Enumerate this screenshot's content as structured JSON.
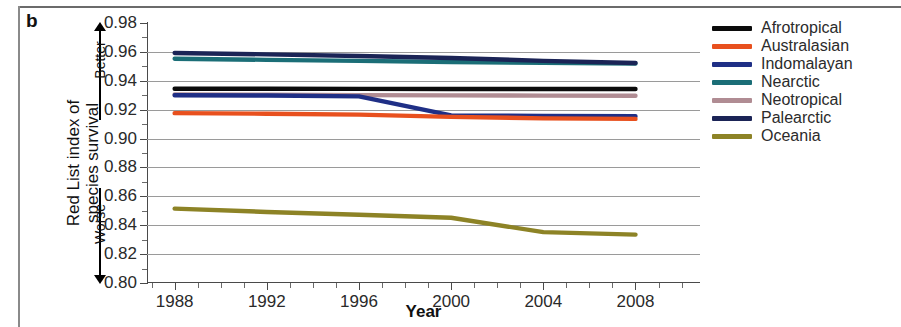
{
  "panel": {
    "label": "b"
  },
  "axes": {
    "y_title": "Red List index of\nspecies survival",
    "x_title": "Year",
    "y_ticks": [
      "0.98",
      "0.96",
      "0.94",
      "0.92",
      "0.90",
      "0.88",
      "0.86",
      "0.84",
      "0.82",
      "0.80"
    ],
    "x_ticks": [
      "1988",
      "1992",
      "1996",
      "2000",
      "2004",
      "2008"
    ],
    "direction_up": "Better",
    "direction_down": "Worse"
  },
  "legend": {
    "items": [
      {
        "label": "Afrotropical",
        "color": "#0b0b0b"
      },
      {
        "label": "Australasian",
        "color": "#e8501e"
      },
      {
        "label": "Indomalayan",
        "color": "#1f2f86"
      },
      {
        "label": "Nearctic",
        "color": "#1b6e77"
      },
      {
        "label": "Neotropical",
        "color": "#b08c93"
      },
      {
        "label": "Palearctic",
        "color": "#1b2456"
      },
      {
        "label": "Oceania",
        "color": "#8d8326"
      }
    ]
  },
  "chart_data": {
    "type": "line",
    "title": "",
    "xlabel": "Year",
    "ylabel": "Red List index of species survival",
    "xlim": [
      1986.8,
      2010.8
    ],
    "ylim": [
      0.8,
      0.98
    ],
    "ytick_step": 0.02,
    "xtick_step": 4,
    "grid": "horizontal",
    "legend_position": "right",
    "annotations": [
      {
        "text": "Better",
        "meaning": "higher index is better",
        "direction": "up"
      },
      {
        "text": "Worse",
        "meaning": "lower index is worse",
        "direction": "down"
      }
    ],
    "x": [
      1988,
      1992,
      1996,
      2000,
      2004,
      2008
    ],
    "series": [
      {
        "name": "Afrotropical",
        "color": "#0b0b0b",
        "values": [
          0.9345,
          0.9345,
          0.9344,
          0.9343,
          0.9343,
          0.9343
        ]
      },
      {
        "name": "Australasian",
        "color": "#e8501e",
        "values": [
          0.9176,
          0.9172,
          0.9166,
          0.915,
          0.914,
          0.9136
        ]
      },
      {
        "name": "Indomalayan",
        "color": "#1f2f86",
        "values": [
          0.93,
          0.9298,
          0.9292,
          0.916,
          0.9157,
          0.9155
        ]
      },
      {
        "name": "Nearctic",
        "color": "#1b6e77",
        "values": [
          0.9553,
          0.9545,
          0.9538,
          0.953,
          0.9524,
          0.952
        ]
      },
      {
        "name": "Neotropical",
        "color": "#b08c93",
        "values": [
          0.9305,
          0.9303,
          0.9301,
          0.9299,
          0.9297,
          0.9296
        ]
      },
      {
        "name": "Palearctic",
        "color": "#1b2456",
        "values": [
          0.9592,
          0.9583,
          0.9572,
          0.9558,
          0.9538,
          0.9523
        ]
      },
      {
        "name": "Oceania",
        "color": "#8d8326",
        "values": [
          0.8515,
          0.8492,
          0.8472,
          0.8452,
          0.8352,
          0.8335
        ]
      }
    ]
  }
}
